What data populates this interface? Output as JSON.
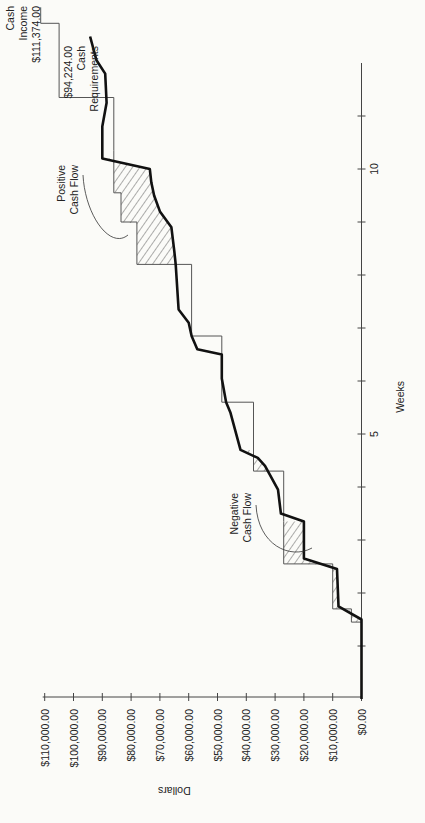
{
  "chart_data": {
    "type": "line",
    "orientation": "rotated-90-ccw",
    "title": "",
    "xlabel": "Weeks",
    "ylabel": "Dollars",
    "xlim": [
      0,
      12
    ],
    "ylim": [
      0,
      110000
    ],
    "x_ticks": [
      1,
      2,
      3,
      4,
      5,
      6,
      7,
      8,
      9,
      10,
      11
    ],
    "x_tick_labels": [
      {
        "value": 5,
        "label": "5"
      },
      {
        "value": 10,
        "label": "10"
      }
    ],
    "y_ticks": [
      {
        "value": 0,
        "label": "$0.00"
      },
      {
        "value": 10000,
        "label": "$10,000.00"
      },
      {
        "value": 20000,
        "label": "$20,000.00"
      },
      {
        "value": 30000,
        "label": "$30,000.00"
      },
      {
        "value": 40000,
        "label": "$40,000.00"
      },
      {
        "value": 50000,
        "label": "$50,000.00"
      },
      {
        "value": 60000,
        "label": "$60,000.00"
      },
      {
        "value": 70000,
        "label": "$70,000.00"
      },
      {
        "value": 80000,
        "label": "$80,000.00"
      },
      {
        "value": 90000,
        "label": "$90,000.00"
      },
      {
        "value": 100000,
        "label": "$100,000.00"
      },
      {
        "value": 110000,
        "label": "$110,000.00"
      }
    ],
    "grid": false,
    "series": [
      {
        "name": "Cash Income",
        "style": "thin-step",
        "points": [
          [
            0,
            0
          ],
          [
            1.45,
            0
          ],
          [
            1.45,
            3500
          ],
          [
            1.7,
            3500
          ],
          [
            1.7,
            10000
          ],
          [
            2.55,
            10000
          ],
          [
            2.55,
            27000
          ],
          [
            3.35,
            27000
          ],
          [
            3.35,
            27000
          ],
          [
            4.3,
            27000
          ],
          [
            4.3,
            37500
          ],
          [
            5.6,
            37500
          ],
          [
            5.6,
            48500
          ],
          [
            6.85,
            48500
          ],
          [
            6.85,
            59000
          ],
          [
            8.2,
            59000
          ],
          [
            8.2,
            78000
          ],
          [
            9.0,
            78000
          ],
          [
            9.0,
            83500
          ],
          [
            9.55,
            83500
          ],
          [
            9.55,
            86000
          ],
          [
            10.35,
            86000
          ],
          [
            10.35,
            86000
          ],
          [
            11.35,
            86000
          ],
          [
            11.35,
            105000
          ],
          [
            12.75,
            105000
          ],
          [
            12.75,
            111374
          ],
          [
            13.05,
            111374
          ]
        ],
        "end_label": [
          "Cash",
          "Income",
          "$111,374.00"
        ]
      },
      {
        "name": "Cash Requirements",
        "style": "thick-line",
        "points": [
          [
            0,
            0
          ],
          [
            1.5,
            0
          ],
          [
            1.75,
            8000
          ],
          [
            2.45,
            8500
          ],
          [
            2.65,
            20000
          ],
          [
            3.35,
            20000
          ],
          [
            3.5,
            28000
          ],
          [
            3.95,
            29000
          ],
          [
            4.4,
            33500
          ],
          [
            4.55,
            36000
          ],
          [
            4.7,
            42000
          ],
          [
            5.4,
            45500
          ],
          [
            5.6,
            47000
          ],
          [
            6.05,
            48500
          ],
          [
            6.5,
            48500
          ],
          [
            6.6,
            57000
          ],
          [
            6.85,
            59000
          ],
          [
            7.1,
            60000
          ],
          [
            7.35,
            63500
          ],
          [
            8.2,
            64500
          ],
          [
            8.45,
            65000
          ],
          [
            8.9,
            66000
          ],
          [
            9.2,
            70000
          ],
          [
            9.5,
            72000
          ],
          [
            9.75,
            73000
          ],
          [
            10.0,
            73500
          ],
          [
            10.2,
            90000
          ],
          [
            10.8,
            90000
          ],
          [
            11.25,
            88500
          ],
          [
            11.8,
            89000
          ],
          [
            12.05,
            92000
          ],
          [
            12.5,
            94224
          ]
        ],
        "end_label": [
          "$94,224.00",
          "Cash",
          "Requirements"
        ]
      }
    ],
    "annotations": [
      {
        "text": [
          "Positive",
          "Cash Flow"
        ],
        "points_to": "hatched area weeks 8–10"
      },
      {
        "text": [
          "Negative",
          "Cash Flow"
        ],
        "points_to": "hatched area weeks 2–3"
      }
    ]
  }
}
